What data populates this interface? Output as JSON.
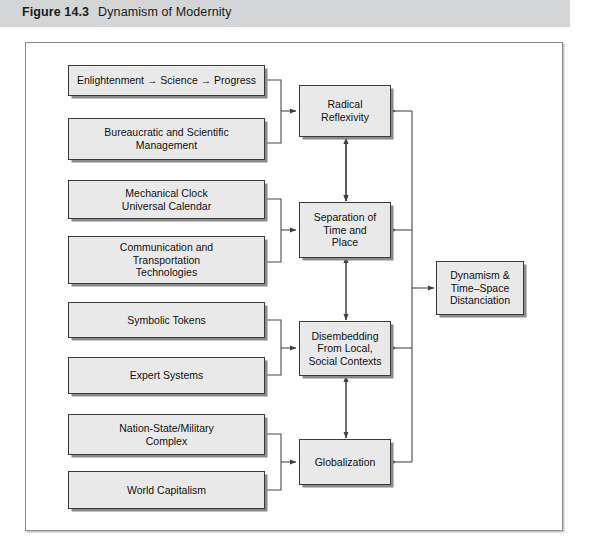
{
  "caption": {
    "figure_number": "Figure 14.3",
    "title": "Dynamism of Modernity"
  },
  "colors": {
    "caption_bar": "#d4d5d7",
    "box_fill": "#e9e9e9",
    "box_border": "#3a3a3a",
    "box_shadow": "#8a8a8a",
    "frame_border": "#8b8d90",
    "wire": "#4a4a4a",
    "page_background": "#ffffff"
  },
  "diagram": {
    "type": "flowchart",
    "columns": 3,
    "inputs": [
      {
        "id": "enlightenment",
        "label": "Enlightenment → Science → Progress",
        "group": 1
      },
      {
        "id": "bureaucratic",
        "label": "Bureaucratic and Scientific\nManagement",
        "group": 1
      },
      {
        "id": "mechanical-clock",
        "label": "Mechanical Clock\nUniversal Calendar",
        "group": 2
      },
      {
        "id": "communication",
        "label": "Communication and\nTransportation\nTechnologies",
        "group": 2
      },
      {
        "id": "symbolic-tokens",
        "label": "Symbolic Tokens",
        "group": 3
      },
      {
        "id": "expert-systems",
        "label": "Expert Systems",
        "group": 3
      },
      {
        "id": "nation-state",
        "label": "Nation-State/Military\nComplex",
        "group": 4
      },
      {
        "id": "world-capitalism",
        "label": "World Capitalism",
        "group": 4
      }
    ],
    "processes": [
      {
        "id": "radical-reflexivity",
        "label": "Radical\nReflexivity",
        "group": 1
      },
      {
        "id": "separation",
        "label": "Separation of\nTime and\nPlace",
        "group": 2
      },
      {
        "id": "disembedding",
        "label": "Disembedding\nFrom Local,\nSocial Contexts",
        "group": 3
      },
      {
        "id": "globalization",
        "label": "Globalization",
        "group": 4
      }
    ],
    "outcome": {
      "id": "dynamism",
      "label": "Dynamism &\nTime–Space\nDistanciation"
    },
    "relations": [
      {
        "from": "group-1-inputs",
        "to": "radical-reflexivity",
        "style": "bracket-arrow"
      },
      {
        "from": "group-2-inputs",
        "to": "separation",
        "style": "bracket-arrow"
      },
      {
        "from": "group-3-inputs",
        "to": "disembedding",
        "style": "bracket-arrow"
      },
      {
        "from": "group-4-inputs",
        "to": "globalization",
        "style": "bracket-arrow"
      },
      {
        "from": "radical-reflexivity",
        "to": "separation",
        "style": "double-arrow-vertical"
      },
      {
        "from": "separation",
        "to": "disembedding",
        "style": "double-arrow-vertical"
      },
      {
        "from": "disembedding",
        "to": "globalization",
        "style": "double-arrow-vertical"
      },
      {
        "from": "radical-reflexivity",
        "to": "dynamism",
        "style": "spine-arrow"
      },
      {
        "from": "separation",
        "to": "dynamism",
        "style": "spine-arrow"
      },
      {
        "from": "disembedding",
        "to": "dynamism",
        "style": "spine-arrow"
      },
      {
        "from": "globalization",
        "to": "dynamism",
        "style": "spine-arrow"
      }
    ]
  }
}
